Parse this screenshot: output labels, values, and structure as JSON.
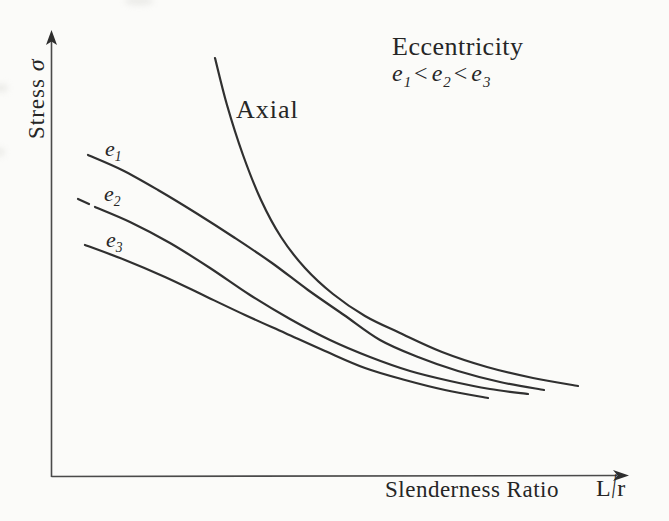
{
  "y_axis": {
    "label_text": "Stress",
    "label_symbol": "σ"
  },
  "x_axis": {
    "label_text": "Slenderness Ratio",
    "unit_numerator": "L",
    "unit_slash": "/",
    "unit_denominator": "r"
  },
  "legend": {
    "title": "Eccentricity",
    "e1_base": "e",
    "e1_sub": "1",
    "op1": "<",
    "e2_base": "e",
    "e2_sub": "2",
    "op2": "<",
    "e3_base": "e",
    "e3_sub": "3"
  },
  "colors": {
    "background": "#fbfbf9",
    "ink": "#2e2e2e",
    "curve": "#303030"
  },
  "chart_data": {
    "type": "line",
    "title": "",
    "xlabel": "Slenderness Ratio L/r",
    "ylabel": "Stress σ",
    "axes_quantitative": false,
    "grid": false,
    "legend_position": "top-right",
    "annotations": [
      "Eccentricity",
      "e1 < e2 < e3"
    ],
    "series": [
      {
        "id": "axial",
        "label": "Axial",
        "points": [
          [
            215,
            58
          ],
          [
            227,
            105
          ],
          [
            243,
            155
          ],
          [
            261,
            200
          ],
          [
            281,
            237
          ],
          [
            305,
            268
          ],
          [
            333,
            294
          ],
          [
            365,
            316
          ],
          [
            400,
            333
          ],
          [
            442,
            352
          ],
          [
            487,
            367
          ],
          [
            533,
            378
          ],
          [
            578,
            386
          ]
        ]
      },
      {
        "id": "e1",
        "label_base": "e",
        "label_sub": "1",
        "points": [
          [
            88,
            155
          ],
          [
            122,
            170
          ],
          [
            158,
            190
          ],
          [
            196,
            213
          ],
          [
            235,
            238
          ],
          [
            272,
            263
          ],
          [
            308,
            290
          ],
          [
            344,
            315
          ],
          [
            380,
            340
          ],
          [
            418,
            357
          ],
          [
            458,
            371
          ],
          [
            500,
            382
          ],
          [
            544,
            390
          ]
        ]
      },
      {
        "id": "e2",
        "label_base": "e",
        "label_sub": "2",
        "points": [
          [
            95,
            207
          ],
          [
            130,
            222
          ],
          [
            170,
            243
          ],
          [
            210,
            268
          ],
          [
            250,
            295
          ],
          [
            290,
            319
          ],
          [
            330,
            340
          ],
          [
            370,
            357
          ],
          [
            410,
            371
          ],
          [
            450,
            381
          ],
          [
            490,
            389
          ],
          [
            528,
            394
          ]
        ]
      },
      {
        "id": "e3",
        "label_base": "e",
        "label_sub": "3",
        "points": [
          [
            85,
            245
          ],
          [
            125,
            260
          ],
          [
            165,
            277
          ],
          [
            205,
            296
          ],
          [
            245,
            315
          ],
          [
            285,
            333
          ],
          [
            325,
            351
          ],
          [
            365,
            368
          ],
          [
            405,
            380
          ],
          [
            445,
            390
          ],
          [
            488,
            398
          ]
        ]
      },
      {
        "id": "e2-lead-dash",
        "label": "",
        "points": [
          [
            78,
            199
          ],
          [
            89,
            204
          ]
        ]
      }
    ]
  }
}
